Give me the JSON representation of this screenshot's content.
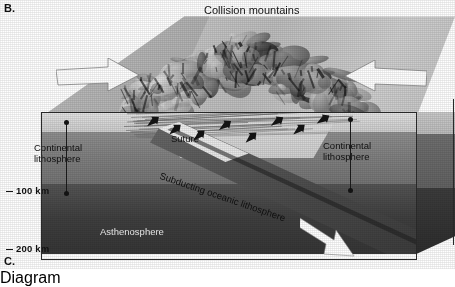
{
  "figure": {
    "panel_label_current": "B.",
    "panel_label_next": "C.",
    "title": "Collision mountains",
    "type": "geological-block-diagram",
    "color_mode": "grayscale"
  },
  "labels": {
    "title": "Collision mountains",
    "suture": "Suture",
    "continental_lithosphere_left": "Continental\nlithosphere",
    "continental_lithosphere_left_line1": "Continental",
    "continental_lithosphere_left_line2": "lithosphere",
    "continental_lithosphere_right_line1": "Continental",
    "continental_lithosphere_right_line2": "lithosphere",
    "subducting_oceanic_lithosphere": "Subducting oceanic lithosphere",
    "asthenosphere": "Asthenosphere"
  },
  "depth_scale": {
    "unit": "km",
    "ticks": [
      {
        "value": "100 km",
        "depth_km": 100
      },
      {
        "value": "200 km",
        "depth_km": 200
      }
    ]
  },
  "arrows": {
    "convergence_left": {
      "name": "plate-convergence-arrow-left",
      "direction": "right",
      "color": "#ffffff"
    },
    "convergence_right": {
      "name": "plate-convergence-arrow-right",
      "direction": "left",
      "color": "#ffffff"
    },
    "subduction": {
      "name": "subduction-direction-arrow",
      "direction": "down-right",
      "angle_deg": 37,
      "color": "#ffffff"
    }
  },
  "layers": [
    {
      "name": "continental-crust",
      "shade": "#d8d8d8"
    },
    {
      "name": "continental-lithosphere",
      "shade": "#7e7e7e"
    },
    {
      "name": "asthenosphere",
      "shade": "#3b3b3b"
    },
    {
      "name": "subducting-oceanic-lithosphere",
      "shade": "#4a4a4a"
    }
  ],
  "icons": {
    "thrust_fault": "thrust-fault-arrow-icon",
    "measurement": "depth-measurement-arrow-icon"
  }
}
